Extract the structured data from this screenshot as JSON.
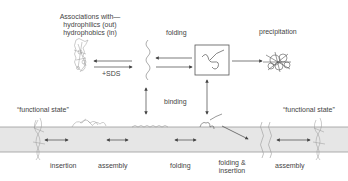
{
  "labels": {
    "associations_line1": "Associations with—",
    "associations_line2": "hydrophilics (out)",
    "associations_line3": "hydrophobics (in)",
    "sds": "+SDS",
    "folding_top": "folding",
    "precipitation": "precipitation",
    "binding": "binding",
    "functional_state_left": "“functional state”",
    "functional_state_right": "“functional state”",
    "insertion": "insertion",
    "assembly_left": "assembly",
    "folding_bottom": "folding",
    "folding_insertion_line1": "folding &",
    "folding_insertion_line2": "insertion",
    "assembly_right": "assembly"
  },
  "colors": {
    "membrane": "#e6e6e6",
    "membrane_edge": "#a0a0a0",
    "arrow": "#444444",
    "protein": "#8a8a8a"
  }
}
